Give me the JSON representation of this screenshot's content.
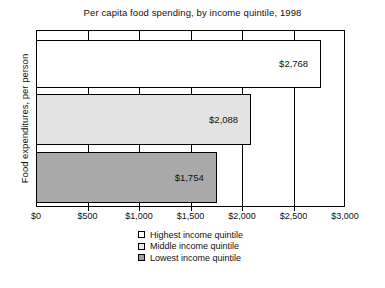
{
  "chart_data": {
    "type": "bar",
    "orientation": "horizontal",
    "title": "Per capita food spending, by income quintile, 1998",
    "xlabel": "",
    "ylabel": "Food expenditures, per person",
    "xlim": [
      0,
      3000
    ],
    "grid": true,
    "legend_position": "bottom",
    "categories": [
      "Highest income quintile",
      "Middle income quintile",
      "Lowest income quintile"
    ],
    "values": [
      2768,
      2088,
      1754
    ],
    "value_labels": [
      "$2,768",
      "$2,088",
      "$1,754"
    ],
    "tick_values": [
      0,
      500,
      1000,
      1500,
      2000,
      2500,
      3000
    ],
    "tick_labels": [
      "$0",
      "$500",
      "$1,000",
      "$1,500",
      "$2,000",
      "$2,500",
      "$3,000"
    ],
    "series": [
      {
        "name": "Highest income quintile",
        "value": 2768,
        "label": "$2,768",
        "color": "#ffffff"
      },
      {
        "name": "Middle income quintile",
        "value": 2088,
        "label": "$2,088",
        "color": "#e3e3e3"
      },
      {
        "name": "Lowest income quintile",
        "value": 1754,
        "label": "$1,754",
        "color": "#a9a9a9"
      }
    ]
  },
  "legend": {
    "items": [
      {
        "label": "Highest income quintile",
        "color": "#ffffff"
      },
      {
        "label": "Middle income quintile",
        "color": "#e8e8e8"
      },
      {
        "label": "Lowest income quintile",
        "color": "#a0a0a0"
      }
    ]
  },
  "colors": {
    "axis": "#000000",
    "text": "#111111",
    "background": "#ffffff",
    "bar_highest": "#ffffff",
    "bar_middle": "#e3e3e3",
    "bar_lowest": "#a9a9a9"
  }
}
